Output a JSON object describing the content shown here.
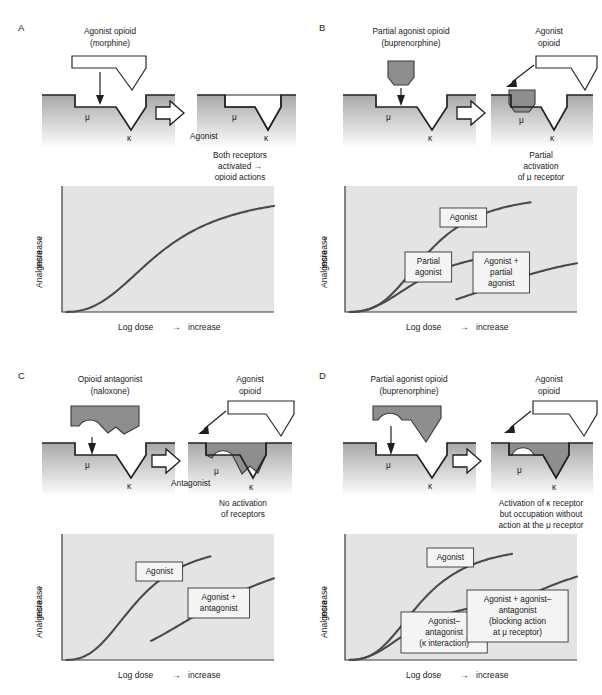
{
  "common": {
    "mu_symbol": "μ",
    "kappa_symbol": "κ",
    "y_axis_label": "Analgesia",
    "y_axis_suffix": "increase",
    "x_axis_label": "Log dose",
    "x_axis_suffix": "increase",
    "arrow_glyph": "→"
  },
  "panels": [
    {
      "id": "A",
      "letter": "A",
      "drug_title_line1": "Agonist opioid",
      "drug_title_line2": "(morphine)",
      "bound_label": "Agonist",
      "second_drug_line1": "",
      "second_drug_line2": "",
      "caption_lines": [
        "Both receptors",
        "activated  →",
        "opioid actions"
      ],
      "chart_data": {
        "type": "line",
        "title": "",
        "xlabel": "Log dose → increase",
        "ylabel": "Analgesia → increase",
        "xlim": [
          0,
          100
        ],
        "ylim": [
          0,
          100
        ],
        "grid": false,
        "legend_position": "inline-callouts",
        "series": [
          {
            "name": "Agonist",
            "label_shown": false,
            "emax": 96,
            "ec50": 47,
            "hill": 2.6,
            "x_start": 2,
            "x_end": 100
          }
        ]
      }
    },
    {
      "id": "B",
      "letter": "B",
      "drug_title_line1": "Partial agonist opioid",
      "drug_title_line2": "(buprenorphine)",
      "bound_label": "",
      "second_drug_line1": "Agonist",
      "second_drug_line2": "opioid",
      "caption_lines": [
        "Partial",
        "activation",
        "of μ receptor"
      ],
      "chart_data": {
        "type": "line",
        "title": "",
        "xlabel": "Log dose → increase",
        "ylabel": "Analgesia → increase",
        "xlim": [
          0,
          100
        ],
        "ylim": [
          0,
          100
        ],
        "grid": false,
        "legend_position": "inline-callouts",
        "series": [
          {
            "name": "Agonist",
            "label_shown": true,
            "label_lines": [
              "Agonist"
            ],
            "emax": 95,
            "ec50": 36,
            "hill": 3.0,
            "x_start": 2,
            "x_end": 80
          },
          {
            "name": "Partial agonist",
            "label_shown": true,
            "label_lines": [
              "Partial",
              "agonist"
            ],
            "emax": 52,
            "ec50": 33,
            "hill": 2.6,
            "x_start": 2,
            "x_end": 60
          },
          {
            "name": "Agonist + partial agonist",
            "label_shown": true,
            "label_lines": [
              "Agonist +",
              "partial",
              "agonist"
            ],
            "emax": 52,
            "ec50": 73,
            "hill": 3.4,
            "x_start": 48,
            "x_end": 100
          }
        ]
      }
    },
    {
      "id": "C",
      "letter": "C",
      "drug_title_line1": "Opioid antagonist",
      "drug_title_line2": "(naloxone)",
      "bound_label": "Antagonist",
      "second_drug_line1": "Agonist",
      "second_drug_line2": "opioid",
      "caption_lines": [
        "No activation",
        "of receptors"
      ],
      "chart_data": {
        "type": "line",
        "title": "",
        "xlabel": "Log dose → increase",
        "ylabel": "Analgesia → increase",
        "xlim": [
          0,
          100
        ],
        "ylim": [
          0,
          100
        ],
        "grid": false,
        "legend_position": "inline-callouts",
        "series": [
          {
            "name": "Agonist",
            "label_shown": true,
            "label_lines": [
              "Agonist"
            ],
            "emax": 95,
            "ec50": 36,
            "hill": 2.8,
            "x_start": 2,
            "x_end": 70
          },
          {
            "name": "Agonist + antagonist",
            "label_shown": true,
            "label_lines": [
              "Agonist +",
              "antagonist"
            ],
            "emax": 95,
            "ec50": 76,
            "hill": 2.8,
            "x_start": 42,
            "x_end": 100
          }
        ]
      }
    },
    {
      "id": "D",
      "letter": "D",
      "drug_title_line1": "Partial agonist opioid",
      "drug_title_line2": "(buprenorphine)",
      "bound_label": "",
      "second_drug_line1": "Agonist",
      "second_drug_line2": "opioid",
      "caption_lines": [
        "Activation of κ receptor",
        "but occupation without",
        "action at the μ receptor"
      ],
      "chart_data": {
        "type": "line",
        "title": "",
        "xlabel": "Log dose → increase",
        "ylabel": "Analgesia → increase",
        "xlim": [
          0,
          100
        ],
        "ylim": [
          0,
          100
        ],
        "grid": false,
        "legend_position": "inline-callouts",
        "series": [
          {
            "name": "Agonist",
            "label_shown": true,
            "label_lines": [
              "Agonist"
            ],
            "emax": 93,
            "ec50": 33,
            "hill": 2.9,
            "x_start": 2,
            "x_end": 72
          },
          {
            "name": "Agonist-antagonist (kappa interaction)",
            "label_shown": true,
            "label_lines": [
              "Agonist–",
              "antagonist",
              "(κ interaction)"
            ],
            "emax": 50,
            "ec50": 30,
            "hill": 2.6,
            "x_start": 2,
            "x_end": 58
          },
          {
            "name": "Agonist + agonist-antagonist (blocking action at mu receptor)",
            "label_shown": true,
            "label_lines": [
              "Agonist + agonist–",
              "antagonist",
              "(blocking action",
              "at μ receptor)"
            ],
            "emax": 93,
            "ec50": 74,
            "hill": 3.0,
            "x_start": 45,
            "x_end": 100
          }
        ]
      }
    }
  ]
}
